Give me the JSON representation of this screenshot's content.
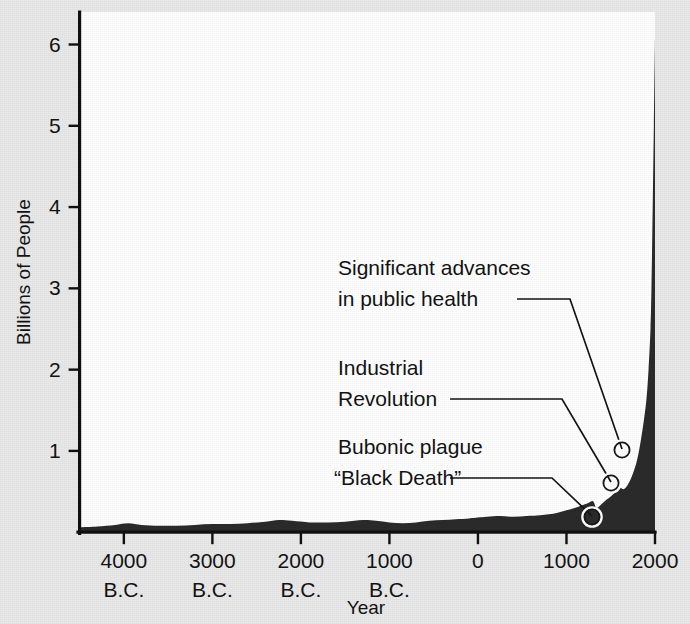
{
  "figure": {
    "background_color": "#e9e9e9",
    "plot_background_color": "#ffffff",
    "area_fill_color": "#2b2b2b",
    "axis_color": "#101010",
    "text_color": "#131313"
  },
  "chart_data": {
    "type": "area",
    "title": "",
    "subtitle": "",
    "xlabel": "Year",
    "ylabel": "Billions of People",
    "grid": false,
    "legend": false,
    "legend_position": "none",
    "xlim": [
      -4500,
      2000
    ],
    "ylim": [
      0,
      6.4
    ],
    "x_tick_values": [
      -4000,
      -3000,
      -2000,
      -1000,
      0,
      1000,
      2000
    ],
    "x_tick_labels": [
      {
        "line1": "4000",
        "line2": "B.C."
      },
      {
        "line1": "3000",
        "line2": "B.C."
      },
      {
        "line1": "2000",
        "line2": "B.C."
      },
      {
        "line1": "1000",
        "line2": "B.C."
      },
      {
        "line1": "0",
        "line2": ""
      },
      {
        "line1": "1000",
        "line2": ""
      },
      {
        "line1": "2000",
        "line2": ""
      }
    ],
    "y_tick_values": [
      1,
      2,
      3,
      4,
      5,
      6
    ],
    "y_tick_labels": [
      "1",
      "2",
      "3",
      "4",
      "5",
      "6"
    ],
    "series": [
      {
        "name": "World population",
        "units": "billions of people",
        "x": [
          -4500,
          -4300,
          -4100,
          -3950,
          -3800,
          -3600,
          -3400,
          -3200,
          -3000,
          -2800,
          -2600,
          -2400,
          -2250,
          -2100,
          -1900,
          -1700,
          -1500,
          -1300,
          -1150,
          -1000,
          -850,
          -700,
          -550,
          -400,
          -250,
          -100,
          0,
          100,
          250,
          400,
          550,
          700,
          800,
          900,
          1000,
          1100,
          1200,
          1250,
          1300,
          1340,
          1400,
          1450,
          1500,
          1550,
          1600,
          1650,
          1700,
          1750,
          1800,
          1850,
          1900,
          1927,
          1950,
          1960,
          1974,
          1987,
          1999,
          2000
        ],
        "y": [
          0.06,
          0.07,
          0.09,
          0.11,
          0.09,
          0.08,
          0.08,
          0.09,
          0.1,
          0.1,
          0.11,
          0.13,
          0.15,
          0.14,
          0.12,
          0.12,
          0.13,
          0.15,
          0.14,
          0.12,
          0.11,
          0.12,
          0.14,
          0.15,
          0.16,
          0.17,
          0.18,
          0.19,
          0.2,
          0.19,
          0.2,
          0.21,
          0.22,
          0.24,
          0.27,
          0.3,
          0.34,
          0.36,
          0.38,
          0.3,
          0.35,
          0.4,
          0.44,
          0.49,
          0.55,
          0.53,
          0.6,
          0.72,
          0.9,
          1.2,
          1.6,
          2.0,
          2.52,
          3.0,
          4.0,
          5.0,
          6.0,
          6.05
        ]
      }
    ],
    "annotations": [
      {
        "id": "public-health",
        "label_lines": [
          "Significant advances",
          "in public health"
        ],
        "point_year": 1750,
        "point_value": 1.0,
        "note": "leader line from text to marker on curve"
      },
      {
        "id": "industrial-revolution",
        "label_lines": [
          "Industrial",
          "Revolution"
        ],
        "point_year": 1650,
        "point_value": 0.62,
        "note": "leader line from text to marker on curve"
      },
      {
        "id": "black-death",
        "label_lines": [
          "Bubonic plague",
          "“Black Death”"
        ],
        "point_year": 1340,
        "point_value": 0.3,
        "note": "leader line from text to marker in the dip on curve"
      }
    ]
  }
}
